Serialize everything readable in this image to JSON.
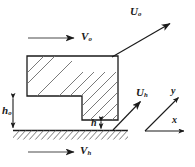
{
  "figure": {
    "background": "#ffffff",
    "line_color": "#1a1a1a",
    "hatch_color": "#6b6b6b",
    "width": 195,
    "height": 167
  },
  "labels": {
    "u_o": {
      "symbol": "U",
      "subscript": "o",
      "text": "Uo"
    },
    "v_o": {
      "symbol": "V",
      "subscript": "o",
      "text": "Vo"
    },
    "u_h": {
      "symbol": "U",
      "subscript": "h",
      "text": "Uh"
    },
    "v_h": {
      "symbol": "V",
      "subscript": "h",
      "text": "Vh"
    },
    "h_o": {
      "symbol": "h",
      "subscript": "o",
      "text": "ho"
    },
    "h": {
      "symbol": "h",
      "subscript": "",
      "text": "h"
    },
    "axis_x": {
      "symbol": "x",
      "subscript": "",
      "text": "x"
    },
    "axis_y": {
      "symbol": "y",
      "subscript": "",
      "text": "y"
    }
  },
  "vectors": [
    {
      "name": "U-o-vector",
      "label": "Uo",
      "from": [
        112,
        57
      ],
      "to": [
        172,
        22
      ],
      "style": "arrow",
      "direction": "up-right"
    },
    {
      "name": "V-o-vector",
      "label": "Vo",
      "from": [
        28,
        38
      ],
      "to": [
        76,
        38
      ],
      "style": "arrow",
      "direction": "right"
    },
    {
      "name": "U-h-vector",
      "label": "Uh",
      "from": [
        113,
        130
      ],
      "to": [
        142,
        100
      ],
      "style": "arrow",
      "direction": "up-right"
    },
    {
      "name": "V-h-vector",
      "label": "Vh",
      "from": [
        28,
        152
      ],
      "to": [
        76,
        152
      ],
      "style": "arrow",
      "direction": "right"
    }
  ],
  "dimensions": [
    {
      "name": "h-o-dimension",
      "label": "ho",
      "orientation": "vertical",
      "x": 13,
      "from_y": 96,
      "to_y": 130,
      "style": "double-arrow"
    },
    {
      "name": "h-dimension",
      "label": "h",
      "orientation": "vertical",
      "x": 101,
      "from_y": 120,
      "to_y": 130,
      "style": "double-arrow"
    }
  ],
  "geometry": {
    "block": {
      "name": "stepped-block",
      "description": "L-shaped hatched slider body",
      "points": "27,56 118,56 118,120 82,120 82,96 27,96",
      "hatched": true
    },
    "ground": {
      "name": "ground-surface",
      "description": "hatched stationary surface",
      "y": 130,
      "x_start": 13,
      "x_end": 128
    }
  },
  "axes": {
    "name": "coordinate-axes",
    "origin": [
      145,
      131
    ],
    "x_end": [
      186,
      131
    ],
    "y_end": [
      180,
      96
    ]
  }
}
